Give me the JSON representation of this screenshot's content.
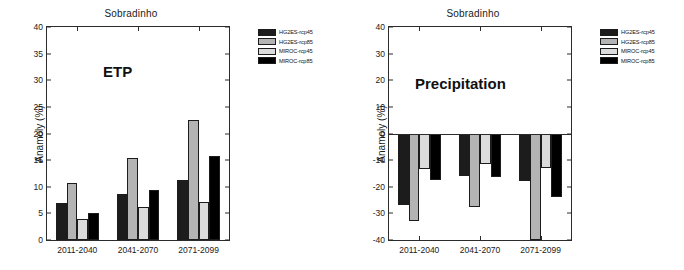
{
  "figure": {
    "panels": [
      {
        "id": "etp",
        "title": "Sobradinho",
        "annotation": "ETP",
        "ylabel": "Anamoly (%)"
      },
      {
        "id": "precipitation",
        "title": "Sobradinho",
        "annotation": "Precipitation",
        "ylabel": "Anamoly (%)"
      }
    ],
    "legend": {
      "entries": [
        {
          "label": "HG2ES-rcp45",
          "color": "#1c1c1c"
        },
        {
          "label": "HG2ES-rcp85",
          "color": "#b4b4b4"
        },
        {
          "label": "MIROC-rcp45",
          "color": "#dcdcdc"
        },
        {
          "label": "MIROC-rcp85",
          "color": "#000000"
        }
      ]
    }
  },
  "chart_data": [
    {
      "type": "bar",
      "title": "Sobradinho",
      "annotation": "ETP",
      "xlabel": "",
      "ylabel": "Anamoly (%)",
      "ylim": [
        0,
        40
      ],
      "yticks": [
        0,
        5,
        10,
        15,
        20,
        25,
        30,
        35,
        40
      ],
      "grid": false,
      "legend_position": "outside-right",
      "categories": [
        "2011-2040",
        "2041-2070",
        "2071-2099"
      ],
      "series": [
        {
          "name": "HG2ES-rcp45",
          "color": "#1c1c1c",
          "values": [
            7.0,
            8.6,
            11.3
          ]
        },
        {
          "name": "HG2ES-rcp85",
          "color": "#b4b4b4",
          "values": [
            10.7,
            15.4,
            22.6
          ]
        },
        {
          "name": "MIROC-rcp45",
          "color": "#dcdcdc",
          "values": [
            4.0,
            6.2,
            7.2
          ]
        },
        {
          "name": "MIROC-rcp85",
          "color": "#000000",
          "values": [
            5.0,
            9.3,
            15.8
          ]
        }
      ]
    },
    {
      "type": "bar",
      "title": "Sobradinho",
      "annotation": "Precipitation",
      "xlabel": "",
      "ylabel": "Anamoly (%)",
      "ylim": [
        -40,
        40
      ],
      "yticks": [
        -40,
        -30,
        -20,
        -10,
        0,
        10,
        20,
        30,
        40
      ],
      "grid": false,
      "legend_position": "outside-right",
      "categories": [
        "2011-2040",
        "2041-2070",
        "2071-2099"
      ],
      "series": [
        {
          "name": "HG2ES-rcp45",
          "color": "#1c1c1c",
          "values": [
            -27.0,
            -16.0,
            -18.0
          ]
        },
        {
          "name": "HG2ES-rcp85",
          "color": "#b4b4b4",
          "values": [
            -33.0,
            -27.5,
            -40.0
          ]
        },
        {
          "name": "MIROC-rcp45",
          "color": "#dcdcdc",
          "values": [
            -13.5,
            -11.3,
            -13.0
          ]
        },
        {
          "name": "MIROC-rcp85",
          "color": "#000000",
          "values": [
            -17.5,
            -16.5,
            -24.0
          ]
        }
      ]
    }
  ]
}
